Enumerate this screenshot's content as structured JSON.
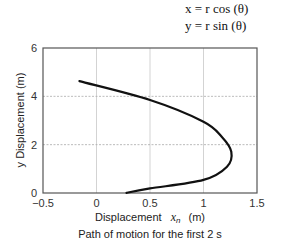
{
  "equations": {
    "line1": "x = r cos (θ)",
    "line2": "y = r sin (θ)"
  },
  "chart_data": {
    "type": "line",
    "title": "",
    "caption": "Path of motion for the first 2 s",
    "xlabel": "Displacement  x_n  (m)",
    "ylabel": "y Displacement (m)",
    "xlim": [
      -0.5,
      1.5
    ],
    "ylim": [
      0,
      6
    ],
    "xticks": [
      -0.5,
      0,
      0.5,
      1,
      1.5
    ],
    "xtick_labels": [
      "−0.5",
      "0",
      "0.5",
      "1",
      "1.5"
    ],
    "yticks": [
      0,
      2,
      4,
      6
    ],
    "ytick_labels": [
      "0",
      "2",
      "4",
      "6"
    ],
    "grid": true,
    "legend": null,
    "series": [
      {
        "name": "path",
        "color": "#111111",
        "x": [
          -0.16,
          0.5,
          1.0,
          1.17,
          1.26,
          1.22,
          1.0,
          0.5,
          0.28
        ],
        "y": [
          4.63,
          3.85,
          2.95,
          2.33,
          1.71,
          1.09,
          0.54,
          0.19,
          0.01
        ]
      }
    ]
  },
  "labels": {
    "xlabel_prefix": "Displacement",
    "xlabel_var": "x",
    "xlabel_sub": "n",
    "xlabel_unit": "(m)",
    "ylabel": "y Displacement (m)",
    "caption": "Path of motion for the first 2 s"
  }
}
